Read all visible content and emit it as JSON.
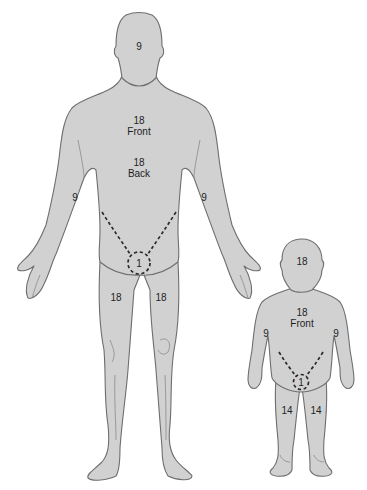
{
  "diagram": {
    "colors": {
      "body_fill": "#d1d1d1",
      "outline": "#6e6e6e",
      "dashed_region": "#2a2a2a",
      "text": "#1e1e1e",
      "background": "#ffffff"
    },
    "adult": {
      "head": "9",
      "trunk_front": {
        "value": "18",
        "label": "Front"
      },
      "trunk_back": {
        "value": "18",
        "label": "Back"
      },
      "right_arm": "9",
      "left_arm": "9",
      "genitalia": "1",
      "right_leg": "18",
      "left_leg": "18"
    },
    "child": {
      "head": "18",
      "trunk_front": {
        "value": "18",
        "label": "Front"
      },
      "right_arm": "9",
      "left_arm": "9",
      "genitalia": "1",
      "right_leg": "14",
      "left_leg": "14"
    }
  }
}
